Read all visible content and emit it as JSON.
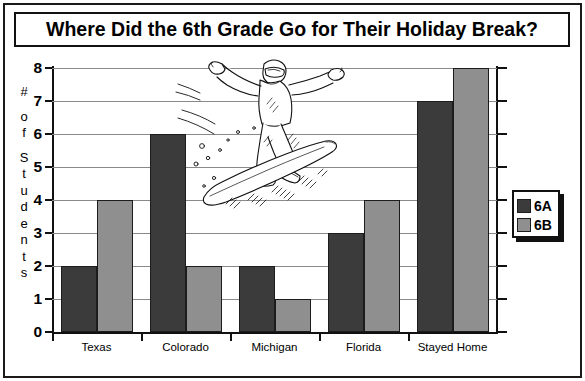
{
  "figure": {
    "title": "Where Did the 6th Grade Go for Their Holiday Break?",
    "ylabel_chars": [
      "#",
      "",
      "o",
      "f",
      "",
      "S",
      "t",
      "u",
      "d",
      "e",
      "n",
      "t",
      "s"
    ],
    "illustration": "snowboarder-illustration"
  },
  "legend": {
    "entries": [
      {
        "label": "6A",
        "color": "#3b3b3b"
      },
      {
        "label": "6B",
        "color": "#8f8f8f"
      }
    ]
  },
  "chart_data": {
    "type": "bar",
    "title": "Where Did the 6th Grade Go for Their Holiday Break?",
    "xlabel": "",
    "ylabel": "# of Students",
    "categories": [
      "Texas",
      "Colorado",
      "Michigan",
      "Florida",
      "Stayed Home"
    ],
    "series": [
      {
        "name": "6A",
        "color": "#3b3b3b",
        "values": [
          2,
          6,
          2,
          3,
          7
        ]
      },
      {
        "name": "6B",
        "color": "#8f8f8f",
        "values": [
          4,
          2,
          1,
          4,
          8
        ]
      }
    ],
    "ylim": [
      0,
      8
    ],
    "yticks": [
      0,
      1,
      2,
      3,
      4,
      5,
      6,
      7,
      8
    ],
    "ytick_labels": [
      "0",
      "1",
      "2",
      "3",
      "4",
      "5",
      "6",
      "7",
      "8"
    ],
    "grid": true,
    "legend_position": "right"
  }
}
